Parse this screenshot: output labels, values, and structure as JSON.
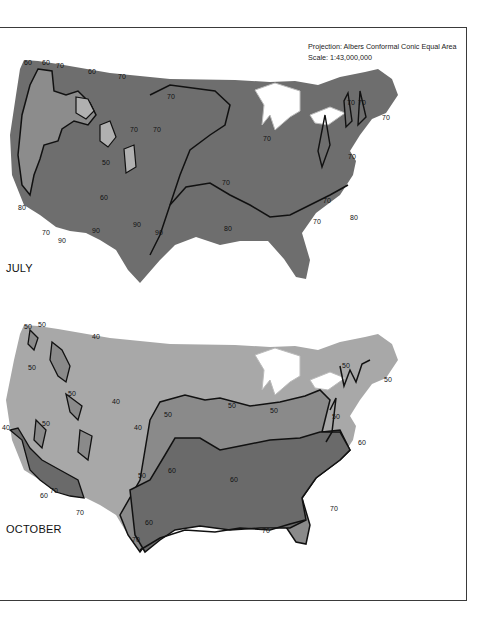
{
  "header": {
    "projection": "Projection: Albers Conformal Conic Equal Area",
    "scale": "Scale: 1:43,000,000"
  },
  "maps": [
    {
      "title": "JULY",
      "fill_color": "#6e6e6e",
      "cool_fill": "#8c8c8c",
      "coolest_fill": "#b0b0b0",
      "isotherm_labels": [
        "60",
        "60",
        "70",
        "60",
        "70",
        "70",
        "70",
        "70",
        "70",
        "70",
        "70",
        "70",
        "70",
        "70",
        "70",
        "50",
        "60",
        "60",
        "70",
        "60",
        "70",
        "80",
        "80",
        "80",
        "80",
        "90",
        "90",
        "90",
        "90",
        "60",
        "70",
        "70",
        "80",
        "70"
      ]
    },
    {
      "title": "OCTOBER",
      "fill_color": "#a8a8a8",
      "mid_fill": "#8a8a8a",
      "warm_fill": "#6a6a6a",
      "isotherm_labels": [
        "50",
        "50",
        "40",
        "50",
        "50",
        "40",
        "50",
        "50",
        "40",
        "40",
        "50",
        "50",
        "50",
        "50",
        "50",
        "50",
        "60",
        "60",
        "60",
        "60",
        "70",
        "70",
        "70",
        "70",
        "70",
        "60"
      ]
    }
  ],
  "colors": {
    "background": "#ffffff",
    "lakes": "#ffffff",
    "contour": "#111111",
    "border": "#3a3a3a"
  }
}
